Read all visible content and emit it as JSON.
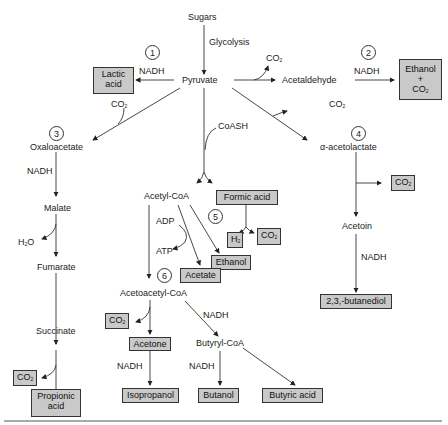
{
  "nodes": {
    "sugars": "Sugars",
    "glycolysis": "Glycolysis",
    "pyruvate": "Pyruvate",
    "acetaldehyde": "Acetaldehyde",
    "oxaloacetate": "Oxaloacetate",
    "malate": "Malate",
    "fumarate": "Fumarate",
    "succinate": "Succinate",
    "acetyl_coa": "Acetyl-CoA",
    "acetoacetyl_coa": "Acetoacetyl-CoA",
    "butyryl_coa": "Butyryl-CoA",
    "alpha_acetolactate": "α-acetolactate",
    "acetoin": "Acetoin",
    "coash": "CoASH",
    "adp": "ADP",
    "atp": "ATP",
    "h2o": "H",
    "h2o_tail": "O"
  },
  "cofactors": {
    "nadh": "NADH",
    "co2": "CO",
    "sub2": "2"
  },
  "products": {
    "lactic_acid_1": "Lactic",
    "lactic_acid_2": "acid",
    "ethanol_co2_1": "Ethanol",
    "ethanol_co2_2": "+",
    "ethanol_co2_3": "CO",
    "formic_acid": "Formic acid",
    "h2": "H",
    "ethanol": "Ethanol",
    "acetate": "Acetate",
    "acetone": "Acetone",
    "isopropanol": "Isopropanol",
    "butanol": "Butanol",
    "butyric_acid": "Butyric acid",
    "propionic_acid_1": "Propionic",
    "propionic_acid_2": "acid",
    "butanediol": "2,3,-butanediol"
  },
  "pathways": [
    "1",
    "2",
    "3",
    "4",
    "5",
    "6"
  ],
  "colors": {
    "product_fill": "#c9c9c9",
    "line": "#333333"
  }
}
